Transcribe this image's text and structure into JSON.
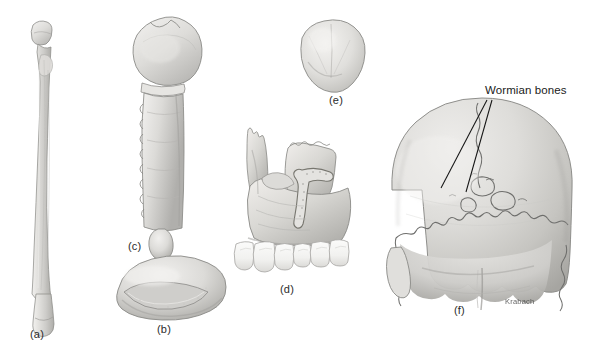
{
  "plate": {
    "title": "Classification of bones by shape",
    "background_color": "#ffffff",
    "width": 596,
    "height": 356
  },
  "palette": {
    "bone_light": "#ecebe9",
    "bone_mid": "#d7d6d3",
    "bone_shadow": "#b9b8b5",
    "bone_deep_shadow": "#9b9a97",
    "outline": "#8a8a88",
    "tooth": "#f7f7f5",
    "tooth_outline": "#a9a9a6",
    "suture_line": "#6e6e6c",
    "leader_line": "#141414",
    "label_text": "#2b2b2b",
    "callout_text": "#1a1a1a",
    "signature_text": "#4a4a4a"
  },
  "figures": [
    {
      "id": "a",
      "label": "(a)",
      "name": "long-bone-fibula",
      "label_x": 38,
      "label_y": 335
    },
    {
      "id": "b",
      "label": "(b)",
      "name": "irregular-bone-vertebral-body",
      "label_x": 165,
      "label_y": 330
    },
    {
      "id": "c",
      "label": "(c)",
      "name": "flat-bone-sternum",
      "label_x": 136,
      "label_y": 247
    },
    {
      "id": "d",
      "label": "(d)",
      "name": "irregular-bone-maxilla-with-teeth",
      "label_x": 288,
      "label_y": 290
    },
    {
      "id": "e",
      "label": "(e)",
      "name": "sesamoid-bone-patella",
      "label_x": 337,
      "label_y": 101
    },
    {
      "id": "f",
      "label": "(f)",
      "name": "skull-posterior-view-occipital",
      "label_x": 462,
      "label_y": 311
    }
  ],
  "annotations": [
    {
      "name": "wormian-bones-callout",
      "text": "Wormian bones",
      "label_x": 485,
      "label_y": 95,
      "leader_lines": [
        {
          "x1": 487,
          "y1": 100,
          "x2": 441,
          "y2": 188
        },
        {
          "x2": 466,
          "y2": 192,
          "x1": 492,
          "y1": 100
        }
      ]
    }
  ],
  "signature": {
    "name": "artist-signature",
    "text": "Krabach",
    "x": 505,
    "y": 303
  }
}
